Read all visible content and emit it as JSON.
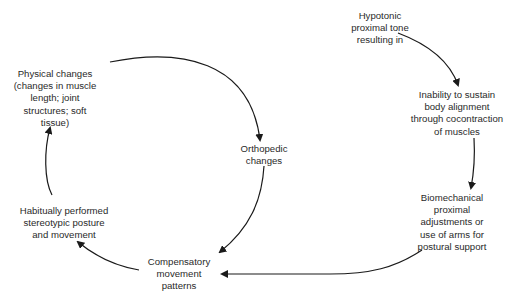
{
  "diagram": {
    "type": "cycle-flow",
    "nodes": [
      {
        "id": "hypotonic",
        "lines": [
          "Hypotonic",
          "proximal tone",
          "resulting in"
        ]
      },
      {
        "id": "inability",
        "lines": [
          "Inability to sustain",
          "body alignment",
          "through cocontraction",
          "of muscles"
        ]
      },
      {
        "id": "biomechanical",
        "lines": [
          "Biomechanical",
          "proximal",
          "adjustments or",
          "use of arms for",
          "postural support"
        ]
      },
      {
        "id": "compensatory",
        "lines": [
          "Compensatory",
          "movement",
          "patterns"
        ]
      },
      {
        "id": "habitual",
        "lines": [
          "Habitually performed",
          "stereotypic posture",
          "and movement"
        ]
      },
      {
        "id": "physical",
        "lines": [
          "Physical changes",
          "(changes in muscle",
          "length; joint",
          "structures; soft",
          "tissue)"
        ]
      },
      {
        "id": "orthopedic",
        "lines": [
          "Orthopedic",
          "changes"
        ]
      }
    ],
    "edges": [
      {
        "from": "hypotonic",
        "to": "inability"
      },
      {
        "from": "inability",
        "to": "biomechanical"
      },
      {
        "from": "biomechanical",
        "to": "compensatory"
      },
      {
        "from": "compensatory",
        "to": "habitual"
      },
      {
        "from": "habitual",
        "to": "physical"
      },
      {
        "from": "physical",
        "to": "orthopedic"
      },
      {
        "from": "orthopedic",
        "to": "compensatory"
      }
    ],
    "line_color": "#1a1a1a"
  }
}
